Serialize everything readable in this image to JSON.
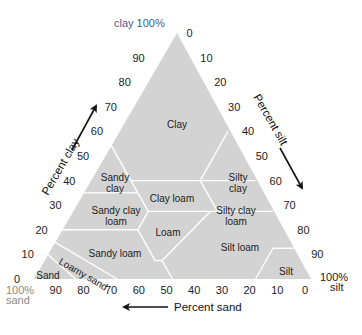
{
  "diagram": {
    "colors": {
      "fill": "#d3d3d3",
      "boundary": "#ffffff",
      "corner_clay": "#4a5a8a",
      "corner_sand": "#8a8a8a",
      "corner_silt": "#222222",
      "tick": "#222222"
    },
    "corners": {
      "clay": "clay 100%",
      "sand_line1": "100%",
      "sand_line2": "sand",
      "silt_line1": "100%",
      "silt_line2": "silt"
    },
    "axes": {
      "clay": {
        "title": "Percent clay",
        "ticks": [
          "0",
          "10",
          "20",
          "30",
          "40",
          "50",
          "60",
          "70",
          "80",
          "90"
        ]
      },
      "silt": {
        "title": "Percent silt",
        "ticks": [
          "0",
          "10",
          "20",
          "30",
          "40",
          "50",
          "60",
          "70",
          "80",
          "90"
        ]
      },
      "sand": {
        "title": "Percent sand",
        "ticks": [
          "90",
          "80",
          "70",
          "60",
          "50",
          "40",
          "30",
          "20",
          "10",
          "0"
        ]
      }
    },
    "regions": [
      {
        "name": "Clay",
        "label": [
          "Clay"
        ]
      },
      {
        "name": "Sandy clay",
        "label": [
          "Sandy",
          "clay"
        ]
      },
      {
        "name": "Silty clay",
        "label": [
          "Silty",
          "clay"
        ]
      },
      {
        "name": "Sandy clay loam",
        "label": [
          "Sandy clay",
          "loam"
        ]
      },
      {
        "name": "Clay loam",
        "label": [
          "Clay loam"
        ]
      },
      {
        "name": "Silty clay loam",
        "label": [
          "Silty clay",
          "loam"
        ]
      },
      {
        "name": "Sandy loam",
        "label": [
          "Sandy loam"
        ]
      },
      {
        "name": "Loam",
        "label": [
          "Loam"
        ]
      },
      {
        "name": "Silt loam",
        "label": [
          "Silt loam"
        ]
      },
      {
        "name": "Loamy sand",
        "label": [
          "Loamy sand"
        ]
      },
      {
        "name": "Sand",
        "label": [
          "Sand"
        ]
      },
      {
        "name": "Silt",
        "label": [
          "Silt"
        ]
      }
    ]
  }
}
